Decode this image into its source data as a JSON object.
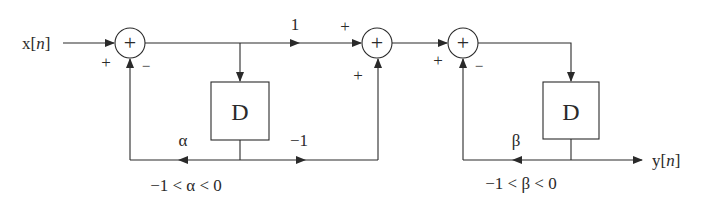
{
  "diagram": {
    "type": "signal-flow block diagram",
    "input": {
      "label": "x[",
      "var": "n",
      "close": "]"
    },
    "output": {
      "label": "y[",
      "var": "n",
      "close": "]"
    },
    "summers": [
      {
        "id": "sum1",
        "symbol": "+",
        "signs": {
          "left": "+",
          "bottom": "−"
        }
      },
      {
        "id": "sum2",
        "symbol": "+",
        "signs": {
          "left": "+",
          "bottom": "+"
        }
      },
      {
        "id": "sum3",
        "symbol": "+",
        "signs": {
          "left": "+",
          "bottom": "−"
        }
      }
    ],
    "delays": [
      {
        "id": "delay1",
        "label": "D"
      },
      {
        "id": "delay2",
        "label": "D"
      }
    ],
    "gains": {
      "forward": "1",
      "alpha": "α",
      "minus_one": "−1",
      "beta": "β"
    },
    "constraints": {
      "alpha": "−1 < α < 0",
      "beta": "−1 < β < 0"
    },
    "colors": {
      "stroke": "#2a2a2a",
      "background": "#ffffff"
    }
  }
}
